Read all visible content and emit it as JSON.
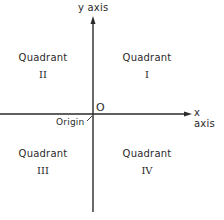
{
  "axes": {
    "y_label": "y axis",
    "x_label": "x axis",
    "origin_marker": "O",
    "origin_label": "Origin"
  },
  "quadrants": [
    {
      "word": "Quadrant",
      "numeral": "I"
    },
    {
      "word": "Quadrant",
      "numeral": "II"
    },
    {
      "word": "Quadrant",
      "numeral": "III"
    },
    {
      "word": "Quadrant",
      "numeral": "IV"
    }
  ],
  "colors": {
    "ink": "#2a2a2a",
    "background": "#ffffff"
  }
}
